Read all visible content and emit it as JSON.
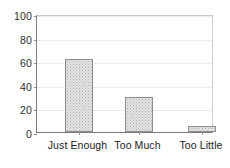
{
  "chart_data": {
    "type": "bar",
    "title": "",
    "subtitle": "",
    "xlabel": "",
    "ylabel": "",
    "categories": [
      "Just Enough",
      "Too Much",
      "Too Little"
    ],
    "values": [
      62,
      30,
      5
    ],
    "series": [
      {
        "name": "Responses",
        "values": [
          62,
          30,
          5
        ]
      }
    ],
    "ylim": [
      0,
      100
    ],
    "yticks": [
      0,
      20,
      40,
      60,
      80,
      100
    ],
    "ytick_labels": [
      "0",
      "20",
      "40",
      "60",
      "80",
      "100"
    ],
    "xtick_labels": [
      "Just Enough",
      "Too Much",
      "Too Little"
    ],
    "grid": true,
    "grid_axis": "y",
    "legend": false,
    "legend_position": "none",
    "annotations": [],
    "colors": {
      "bar_fill": "#e3e3e3",
      "bar_pattern": "#b2b2b2",
      "bar_border": "#8e8e8e",
      "axis": "#7b7b7b",
      "gridline": "#d8d8d8",
      "text": "#222222",
      "background": "#ffffff"
    }
  }
}
